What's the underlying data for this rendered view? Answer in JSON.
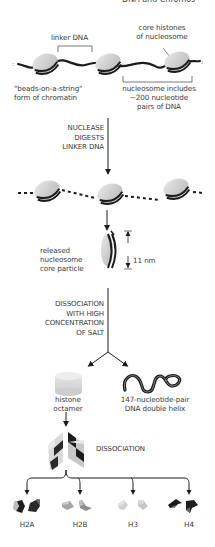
{
  "header": {
    "left_fragment": "",
    "right_fragment": "DNA and Chromos"
  },
  "stage1": {
    "linker_label": "linker DNA",
    "core_histones_label": [
      "core histones",
      "of nucleosome"
    ],
    "beads_label": [
      "\"beads-on-a-string\"",
      "form of chromatin"
    ],
    "nucleosome_label": [
      "nucleosome includes",
      "~200 nucleotide",
      "pairs of DNA"
    ]
  },
  "step1": {
    "label": [
      "NUCLEASE",
      "DIGESTS",
      "LINKER DNA"
    ]
  },
  "stage2": {
    "released_label": [
      "released",
      "nucleosome",
      "core particle"
    ],
    "size_label": "11 nm"
  },
  "step2": {
    "label": [
      "DISSOCIATION",
      "WITH HIGH",
      "CONCENTRATION",
      "OF SALT"
    ]
  },
  "stage3": {
    "octamer_label": [
      "histone",
      "octamer"
    ],
    "dna_label": [
      "147-nucleotide-pair",
      "DNA double helix"
    ]
  },
  "step3": {
    "label": "DISSOCIATION"
  },
  "histones": [
    {
      "name": "H2A",
      "color_a": "#1e1e1e",
      "color_b": "#4a4a4a"
    },
    {
      "name": "H2B",
      "color_a": "#9a9a9a",
      "color_b": "#c0c0c0"
    },
    {
      "name": "H3",
      "color_a": "#c8c8c8",
      "color_b": "#dedede"
    },
    {
      "name": "H4",
      "color_a": "#1a1a1a",
      "color_b": "#3a3a3a"
    }
  ],
  "colors": {
    "dna": "#1c1c1c",
    "bead_fill": "#cfcfcf",
    "bead_light": "#e6e6e6",
    "text": "#3a3a3a"
  }
}
